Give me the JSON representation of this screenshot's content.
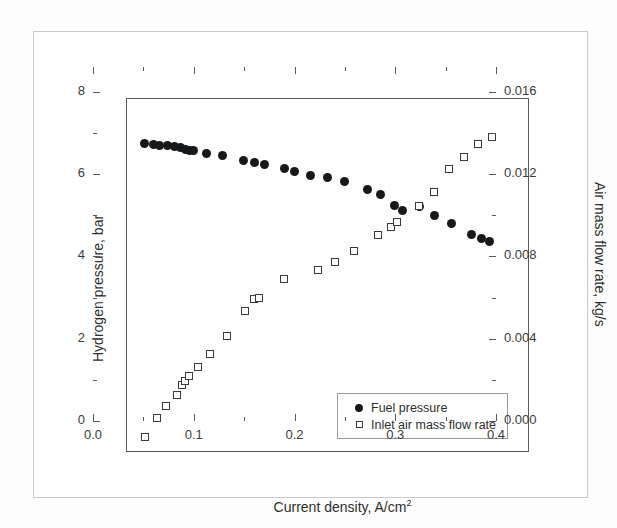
{
  "chart_data": {
    "type": "scatter",
    "title": "",
    "xlabel": "Current density, A/cm",
    "xlabel_superscript": "2",
    "xlabel_full": "Current density, A/cm²",
    "ylabel_left": "Hydrogen pressure, bar",
    "ylabel_right": "Air mass flow rate, kg/s",
    "xlim": [
      0.0,
      0.4
    ],
    "ylim_left": [
      0,
      8.6
    ],
    "ylim_right": [
      0.0,
      0.0172
    ],
    "xticks": [
      0.0,
      0.1,
      0.2,
      0.3,
      0.4
    ],
    "xtick_labels": [
      "0.0",
      "0.1",
      "0.2",
      "0.3",
      "0.4"
    ],
    "xminor_ticks": [
      0.05,
      0.15,
      0.25,
      0.35
    ],
    "yticks_left": [
      0,
      2,
      4,
      6,
      8
    ],
    "ytick_labels_left": [
      "0",
      "2",
      "4",
      "6",
      "8"
    ],
    "yminor_ticks_left": [
      1,
      3,
      5,
      7
    ],
    "yticks_right": [
      0.0,
      0.004,
      0.008,
      0.012,
      0.016
    ],
    "ytick_labels_right": [
      "0.000",
      "0.004",
      "0.008",
      "0.012",
      "0.016"
    ],
    "yminor_ticks_right": [
      0.002,
      0.006,
      0.01,
      0.014
    ],
    "grid": false,
    "legend_position": "lower right",
    "series": [
      {
        "name": "Fuel pressure",
        "marker": "filled-circle",
        "color": "#16181a",
        "axis": "left",
        "points": [
          [
            0.017,
            7.52
          ],
          [
            0.026,
            7.5
          ],
          [
            0.032,
            7.48
          ],
          [
            0.04,
            7.46
          ],
          [
            0.047,
            7.44
          ],
          [
            0.053,
            7.42
          ],
          [
            0.058,
            7.38
          ],
          [
            0.062,
            7.36
          ],
          [
            0.066,
            7.35
          ],
          [
            0.079,
            7.28
          ],
          [
            0.095,
            7.22
          ],
          [
            0.116,
            7.1
          ],
          [
            0.127,
            7.06
          ],
          [
            0.136,
            7.0
          ],
          [
            0.156,
            6.9
          ],
          [
            0.166,
            6.84
          ],
          [
            0.182,
            6.74
          ],
          [
            0.199,
            6.7
          ],
          [
            0.216,
            6.6
          ],
          [
            0.239,
            6.4
          ],
          [
            0.252,
            6.28
          ],
          [
            0.266,
            6.02
          ],
          [
            0.273,
            5.9
          ],
          [
            0.29,
            5.98
          ],
          [
            0.305,
            5.76
          ],
          [
            0.322,
            5.58
          ],
          [
            0.342,
            5.3
          ],
          [
            0.352,
            5.2
          ],
          [
            0.36,
            5.14
          ]
        ]
      },
      {
        "name": "Inlet air mass flow rate",
        "marker": "open-square",
        "color": "#3a3a3a",
        "axis": "right",
        "points": [
          [
            0.018,
            0.00078
          ],
          [
            0.03,
            0.00168
          ],
          [
            0.039,
            0.0023
          ],
          [
            0.05,
            0.00282
          ],
          [
            0.055,
            0.0033
          ],
          [
            0.058,
            0.00352
          ],
          [
            0.062,
            0.00372
          ],
          [
            0.07,
            0.0042
          ],
          [
            0.082,
            0.00482
          ],
          [
            0.099,
            0.0057
          ],
          [
            0.117,
            0.0069
          ],
          [
            0.126,
            0.00748
          ],
          [
            0.131,
            0.00752
          ],
          [
            0.156,
            0.00846
          ],
          [
            0.19,
            0.0089
          ],
          [
            0.206,
            0.0093
          ],
          [
            0.225,
            0.0098
          ],
          [
            0.249,
            0.0106
          ],
          [
            0.262,
            0.011
          ],
          [
            0.268,
            0.0112
          ],
          [
            0.29,
            0.012
          ],
          [
            0.305,
            0.0127
          ],
          [
            0.32,
            0.0138
          ],
          [
            0.334,
            0.0144
          ],
          [
            0.348,
            0.015
          ],
          [
            0.362,
            0.01534
          ]
        ]
      }
    ],
    "legend": [
      {
        "label": "Fuel pressure",
        "marker": "filled-circle"
      },
      {
        "label": "Inlet air mass flow rate",
        "marker": "open-square"
      }
    ]
  }
}
